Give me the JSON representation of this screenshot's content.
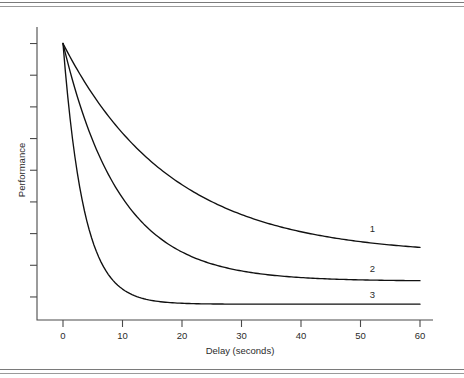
{
  "figure": {
    "rule_top_name": "top-double-rule",
    "rule_bottom_name": "bottom-double-rule"
  },
  "chart_data": {
    "type": "line",
    "title": "",
    "subtitle": "",
    "xlabel": "Delay (seconds)",
    "ylabel": "Performance",
    "xlim": [
      -2,
      61
    ],
    "ylim": [
      0,
      1
    ],
    "xticks": [
      0,
      10,
      20,
      30,
      40,
      50,
      60
    ],
    "xticklabels": [
      "0",
      "10",
      "20",
      "30",
      "40",
      "50",
      "60"
    ],
    "yticks": [
      0.08,
      0.19,
      0.3,
      0.41,
      0.52,
      0.63,
      0.74,
      0.85,
      0.96
    ],
    "yticklabels": [
      "",
      "",
      "",
      "",
      "",
      "",
      "",
      "",
      ""
    ],
    "grid": false,
    "legend_position": "inline-right-end-of-curve",
    "annotations": [
      {
        "text": "1",
        "x": 52,
        "y": 0.305,
        "series": "1"
      },
      {
        "text": "2",
        "x": 52,
        "y": 0.165,
        "series": "2"
      },
      {
        "text": "3",
        "x": 52,
        "y": 0.075,
        "series": "3"
      }
    ],
    "x": [
      0,
      1,
      2,
      3,
      4,
      5,
      6,
      8,
      10,
      12,
      14,
      16,
      18,
      20,
      22,
      25,
      28,
      30,
      33,
      36,
      40,
      44,
      48,
      52,
      56,
      60
    ],
    "series": [
      {
        "name": "1",
        "label": "1",
        "decay_rate": 0.055,
        "asymptote": 0.225,
        "values": [
          0.96,
          0.921,
          0.884,
          0.849,
          0.816,
          0.785,
          0.755,
          0.701,
          0.653,
          0.611,
          0.573,
          0.54,
          0.51,
          0.484,
          0.46,
          0.429,
          0.403,
          0.388,
          0.369,
          0.352,
          0.333,
          0.318,
          0.305,
          0.295,
          0.287,
          0.28
        ]
      },
      {
        "name": "2",
        "label": "2",
        "decay_rate": 0.105,
        "asymptote": 0.135,
        "values": [
          0.96,
          0.878,
          0.804,
          0.738,
          0.679,
          0.625,
          0.577,
          0.496,
          0.431,
          0.378,
          0.335,
          0.3,
          0.272,
          0.248,
          0.229,
          0.206,
          0.19,
          0.181,
          0.171,
          0.163,
          0.155,
          0.149,
          0.145,
          0.142,
          0.14,
          0.138
        ]
      },
      {
        "name": "3",
        "label": "3",
        "decay_rate": 0.285,
        "asymptote": 0.055,
        "values": [
          0.96,
          0.735,
          0.566,
          0.439,
          0.343,
          0.271,
          0.217,
          0.146,
          0.105,
          0.081,
          0.067,
          0.062,
          0.058,
          0.057,
          0.056,
          0.055,
          0.055,
          0.055,
          0.055,
          0.055,
          0.055,
          0.055,
          0.055,
          0.055,
          0.055,
          0.055
        ]
      }
    ]
  }
}
